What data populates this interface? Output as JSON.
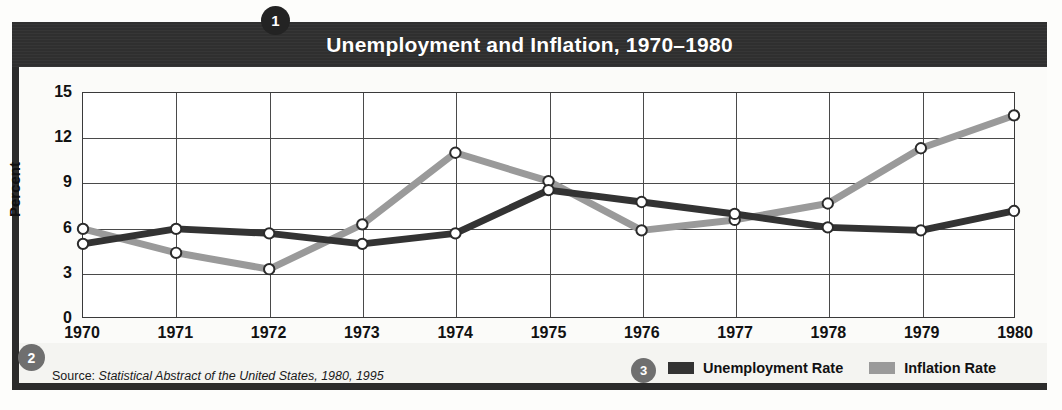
{
  "title": "Unemployment and Inflation, 1970–1980",
  "badges": {
    "one": "1",
    "two": "2",
    "three": "3"
  },
  "source": {
    "prefix": "Source:",
    "citation": "Statistical Abstract of the United States, 1980, 1995"
  },
  "legend": {
    "position": "bottom-right",
    "items": [
      {
        "label": "Unemployment Rate",
        "color": "#333333",
        "swatch": "unemployment-swatch"
      },
      {
        "label": "Inflation Rate",
        "color": "#9a9a9a",
        "swatch": "inflation-swatch"
      }
    ]
  },
  "chart_data": {
    "type": "line",
    "title": "Unemployment and Inflation, 1970–1980",
    "xlabel": "",
    "ylabel": "Percent",
    "x": [
      1970,
      1971,
      1972,
      1973,
      1974,
      1975,
      1976,
      1977,
      1978,
      1979,
      1980
    ],
    "xtick_labels": [
      "1970",
      "1971",
      "1972",
      "1973",
      "1974",
      "1975",
      "1976",
      "1977",
      "1978",
      "1979",
      "1980"
    ],
    "ytick_labels": [
      "0",
      "3",
      "6",
      "9",
      "12",
      "15"
    ],
    "yticks": [
      0,
      3,
      6,
      9,
      12,
      15
    ],
    "ylim": [
      0,
      15
    ],
    "xlim": [
      1970,
      1980
    ],
    "grid": true,
    "series": [
      {
        "name": "Unemployment Rate",
        "color": "#333333",
        "values": [
          4.9,
          5.9,
          5.6,
          4.9,
          5.6,
          8.5,
          7.7,
          6.9,
          6.0,
          5.8,
          7.1
        ]
      },
      {
        "name": "Inflation Rate",
        "color": "#9a9a9a",
        "values": [
          5.9,
          4.3,
          3.2,
          6.2,
          11.0,
          9.1,
          5.8,
          6.5,
          7.6,
          11.3,
          13.5
        ]
      }
    ]
  }
}
